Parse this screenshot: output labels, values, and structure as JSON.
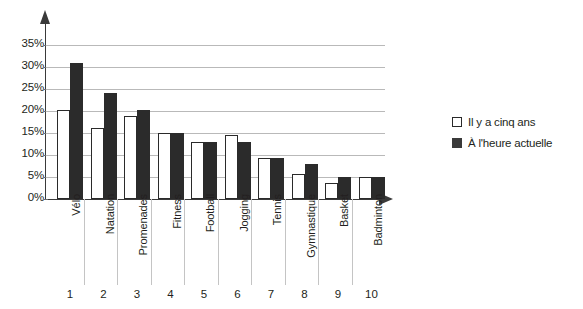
{
  "chart_data": {
    "type": "bar",
    "title": "",
    "subtitle": "",
    "xlabel": "",
    "ylabel": "",
    "categories": [
      "Vélo",
      "Natation",
      "Promenades",
      "Fitness",
      "Football",
      "Jogging",
      "Tennis",
      "Gymnastique",
      "Basket",
      "Badminton"
    ],
    "category_numbers": [
      "1",
      "2",
      "3",
      "4",
      "5",
      "6",
      "7",
      "8",
      "9",
      "10"
    ],
    "series": [
      {
        "name": "Il y a cinq ans",
        "color": "#ffffff",
        "values": [
          20.3,
          16.2,
          18.8,
          15.0,
          12.9,
          14.5,
          9.4,
          5.6,
          3.6,
          5.0
        ]
      },
      {
        "name": "À l'heure actuelle",
        "color": "#2b2b2b",
        "values": [
          31.0,
          24.0,
          20.3,
          15.1,
          12.9,
          13.0,
          9.4,
          7.9,
          5.0,
          5.0
        ]
      }
    ],
    "ylim": [
      0,
      35
    ],
    "ytick_values": [
      0,
      5,
      10,
      15,
      20,
      25,
      30,
      35
    ],
    "ytick_labels": [
      "0%",
      "5%",
      "10%",
      "15%",
      "20%",
      "25%",
      "30%",
      "35%"
    ],
    "grid": true,
    "grid_axis": "y",
    "legend_position": "right",
    "axis_arrows": true
  },
  "legend": {
    "items": [
      {
        "label": "Il y a cinq ans",
        "swatch": "white-square"
      },
      {
        "label": "À l'heure actuelle",
        "swatch": "black-square"
      }
    ]
  },
  "colors": {
    "series_past": "#ffffff",
    "series_now": "#2b2b2b",
    "grid": "#b9b9b9",
    "axis": "#3a3a3a",
    "text": "#231f20",
    "background": "#ffffff"
  }
}
